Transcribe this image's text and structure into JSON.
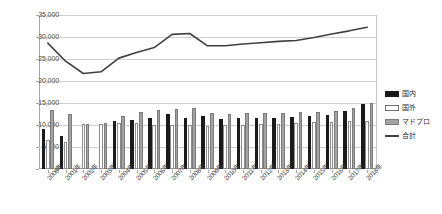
{
  "chart_data": {
    "type": "bar",
    "title": "",
    "subtitle": "",
    "xlabel": "",
    "ylabel": "",
    "ylim": [
      0,
      35000
    ],
    "ytick_labels": [
      "0",
      "5,000",
      "10,000",
      "15,000",
      "20,000",
      "25,000",
      "30,000",
      "35,000"
    ],
    "ytick_values": [
      0,
      5000,
      10000,
      15000,
      20000,
      25000,
      30000,
      35000
    ],
    "grid": true,
    "legend_position": "right",
    "categories": [
      "2000年",
      "2001年",
      "2002年",
      "2003年",
      "2004年",
      "2005年",
      "2006年",
      "2007年",
      "2008年",
      "2009年",
      "2010年",
      "2011年",
      "2012年",
      "2013年",
      "2014年",
      "2015年",
      "2016年",
      "2017年",
      "2018年"
    ],
    "series": [
      {
        "name": "国内",
        "kind": "bar",
        "color": "#1a1a1a",
        "values": [
          9200,
          7600,
          0,
          0,
          11000,
          11100,
          11600,
          12400,
          11600,
          12000,
          11300,
          11500,
          11600,
          11700,
          11800,
          12100,
          12300,
          13100,
          14800
        ]
      },
      {
        "name": "国外",
        "kind": "bar",
        "color": "#ffffff",
        "values": [
          6600,
          6200,
          10200,
          10300,
          10400,
          10400,
          10000,
          9900,
          9900,
          9800,
          10000,
          10100,
          10200,
          10300,
          10400,
          10600,
          10700,
          10800,
          10900
        ]
      },
      {
        "name": "マドプロ",
        "kind": "bar",
        "color": "#a3a3a3",
        "values": [
          13300,
          12500,
          10300,
          10400,
          12000,
          13000,
          13300,
          13600,
          13900,
          12700,
          12400,
          12800,
          12800,
          12800,
          12900,
          13000,
          13200,
          13900,
          15000
        ]
      },
      {
        "name": "合計",
        "kind": "line",
        "color": "#404040",
        "values": [
          28600,
          24500,
          21700,
          22100,
          25200,
          26500,
          27600,
          30600,
          30800,
          28000,
          28000,
          28400,
          28700,
          29000,
          29200,
          29900,
          30700,
          31400,
          32200
        ]
      }
    ]
  },
  "legend": {
    "items": [
      {
        "label": "国内"
      },
      {
        "label": "国外"
      },
      {
        "label": "マドプロ"
      },
      {
        "label": "合計"
      }
    ]
  }
}
